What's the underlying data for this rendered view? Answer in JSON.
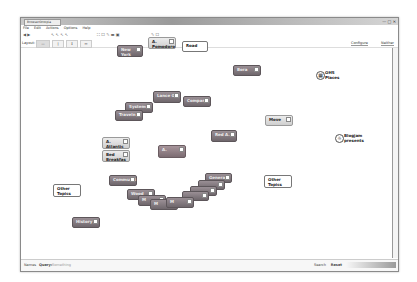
{
  "window": {
    "title": "BrowserOntopia",
    "controls": "— □ ✕"
  },
  "menu": [
    "File",
    "Edit",
    "Actions",
    "Options",
    "Help"
  ],
  "toolbar": {
    "nav": "◀ ▶",
    "group1": "↖ ↖ ↖ ↖",
    "group2": "⛶ ☐ ✎ ▬ ▣",
    "group3": "✎ ☐"
  },
  "layoutbar": {
    "label": "Layout:",
    "buttons": [
      "—",
      "|",
      "↕",
      "↔"
    ],
    "configure": "Configure",
    "neighbor": "Neither"
  },
  "nodes": [
    {
      "id": "new-york",
      "label": "New York",
      "style": "dark",
      "x": 117,
      "y": 45,
      "w": 26,
      "h": 12
    },
    {
      "id": "a-pomodoro",
      "label": "A. Pomodoro",
      "style": "light",
      "x": 148,
      "y": 37,
      "w": 28,
      "h": 12
    },
    {
      "id": "road",
      "label": "Road",
      "style": "white",
      "x": 182,
      "y": 41,
      "w": 26,
      "h": 11
    },
    {
      "id": "bora",
      "label": "Bora",
      "style": "dark",
      "x": 233,
      "y": 65,
      "w": 28,
      "h": 11
    },
    {
      "id": "lance-g",
      "label": "Lance G.",
      "style": "dark",
      "x": 153,
      "y": 91,
      "w": 28,
      "h": 12
    },
    {
      "id": "systems",
      "label": "Systems",
      "style": "dark",
      "x": 125,
      "y": 102,
      "w": 28,
      "h": 11
    },
    {
      "id": "company",
      "label": "Company",
      "style": "dark",
      "x": 183,
      "y": 96,
      "w": 28,
      "h": 11
    },
    {
      "id": "traveln",
      "label": "Traveln",
      "style": "dark",
      "x": 115,
      "y": 110,
      "w": 28,
      "h": 11
    },
    {
      "id": "move",
      "label": "Move",
      "style": "light",
      "x": 265,
      "y": 115,
      "w": 28,
      "h": 11
    },
    {
      "id": "red-a",
      "label": "Red A.",
      "style": "dark",
      "x": 211,
      "y": 130,
      "w": 26,
      "h": 12
    },
    {
      "id": "a-atlantic",
      "label": "A. Atlantic",
      "style": "light",
      "x": 102,
      "y": 137,
      "w": 28,
      "h": 12
    },
    {
      "id": "bed-breakfast",
      "label": "Bed Breakfas",
      "style": "light",
      "x": 102,
      "y": 150,
      "w": 28,
      "h": 12
    },
    {
      "id": "a",
      "label": "A.",
      "style": "red",
      "x": 158,
      "y": 145,
      "w": 28,
      "h": 13
    },
    {
      "id": "communit",
      "label": "Communit",
      "style": "dark",
      "x": 109,
      "y": 175,
      "w": 28,
      "h": 11
    },
    {
      "id": "other-topics-left",
      "label": "Other Topics",
      "style": "white",
      "x": 53,
      "y": 184,
      "w": 28,
      "h": 13
    },
    {
      "id": "other-topics-right",
      "label": "Other Topics",
      "style": "white",
      "x": 264,
      "y": 175,
      "w": 28,
      "h": 13
    },
    {
      "id": "general",
      "label": "General",
      "style": "dark",
      "x": 205,
      "y": 173,
      "w": 27,
      "h": 10
    },
    {
      "id": "stack-1",
      "label": "",
      "style": "dark",
      "x": 198,
      "y": 180,
      "w": 27,
      "h": 10
    },
    {
      "id": "stack-2",
      "label": "",
      "style": "dark",
      "x": 190,
      "y": 186,
      "w": 27,
      "h": 10
    },
    {
      "id": "stack-3",
      "label": "",
      "style": "dark",
      "x": 182,
      "y": 191,
      "w": 27,
      "h": 10
    },
    {
      "id": "wood",
      "label": "Wood",
      "style": "dark",
      "x": 127,
      "y": 189,
      "w": 28,
      "h": 11
    },
    {
      "id": "stack-4",
      "label": "M",
      "style": "dark",
      "x": 138,
      "y": 195,
      "w": 28,
      "h": 11
    },
    {
      "id": "stack-5",
      "label": "M",
      "style": "dark",
      "x": 150,
      "y": 199,
      "w": 28,
      "h": 11
    },
    {
      "id": "stack-6",
      "label": "M",
      "style": "dark",
      "x": 166,
      "y": 197,
      "w": 28,
      "h": 11
    },
    {
      "id": "history",
      "label": "History",
      "style": "dark",
      "x": 72,
      "y": 217,
      "w": 28,
      "h": 11
    }
  ],
  "icon_nodes": [
    {
      "id": "ohs-places",
      "label1": "OHS",
      "label2": "Places",
      "icon": "building-icon",
      "glyph": "▦",
      "x": 316,
      "y": 71
    },
    {
      "id": "blogjam",
      "label1": "Blogjam",
      "label2": "presents",
      "icon": "sun-icon",
      "glyph": "☼",
      "x": 335,
      "y": 134
    }
  ],
  "statusbar": {
    "items": [
      "Names",
      "Query:",
      "Something"
    ],
    "right_items": [
      "Search",
      "Reset"
    ]
  }
}
